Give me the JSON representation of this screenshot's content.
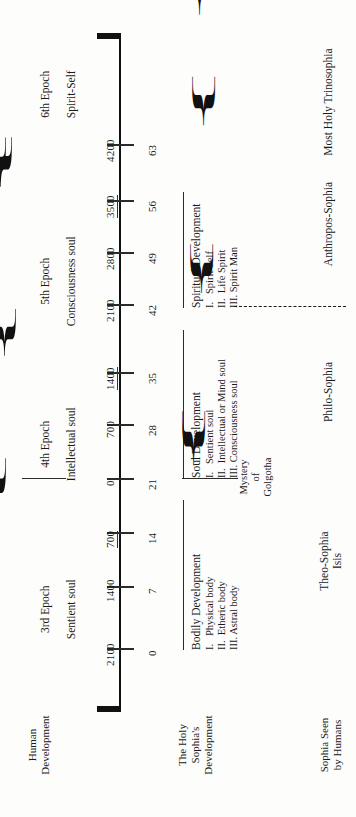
{
  "diagram": {
    "corner_labels": {
      "human_development": "Human\nDevelopment",
      "holy_sophia": "The Holy\nSophia's\nDevelopment",
      "sophia_seen": "Sophia Seen\nby Humans"
    },
    "axis": {
      "ticks": [
        {
          "year": "4200",
          "age": "63",
          "underline": false
        },
        {
          "year": "3500",
          "age": "56",
          "underline": true
        },
        {
          "year": "2800",
          "age": "49",
          "underline": false
        },
        {
          "year": "2100",
          "age": "42",
          "underline": false
        },
        {
          "year": "1400",
          "age": "35",
          "underline": true
        },
        {
          "year": "700",
          "age": "28",
          "underline": false
        },
        {
          "year": "0",
          "age": "21",
          "underline": false
        },
        {
          "year": "700",
          "age": "14",
          "underline": true
        },
        {
          "year": "1400",
          "age": "7",
          "underline": false
        },
        {
          "year": "2100",
          "age": "0",
          "underline": false
        }
      ]
    },
    "epochs": [
      {
        "line1": "6th Epoch",
        "line2": "Spirit-Self"
      },
      {
        "line1": "5th Epoch",
        "line2": "Consciousness soul"
      },
      {
        "line1": "4th Epoch",
        "line2": "Intellectual soul"
      },
      {
        "line1": "3rd Epoch",
        "line2": "Sentient soul"
      }
    ],
    "development": [
      {
        "heading": "Spiritual Development",
        "items": [
          "I.   Spirit Self",
          "II.  Life Spirit",
          "III. Spirit Man"
        ]
      },
      {
        "heading": "Soul Development",
        "items": [
          "I.   Sentient soul",
          "II.  Intellectual or Mind soul",
          "III. Consciousness soul"
        ]
      },
      {
        "heading": "Bodily Development",
        "items": [
          "I.   Physical body",
          "II.  Etheric body",
          "III. Astral body"
        ]
      }
    ],
    "mystery": "Mystery\nof\nGolgotha",
    "sophia_names": [
      "Most Holy Trinosophia",
      "Anthropos-Sophia",
      "Philo-Sophia",
      "Theo-Sophia\nIsis"
    ],
    "colors": {
      "ink": "#1a1a1a",
      "rule": "#2b2b2b",
      "paper": "#fdfdfc"
    }
  }
}
